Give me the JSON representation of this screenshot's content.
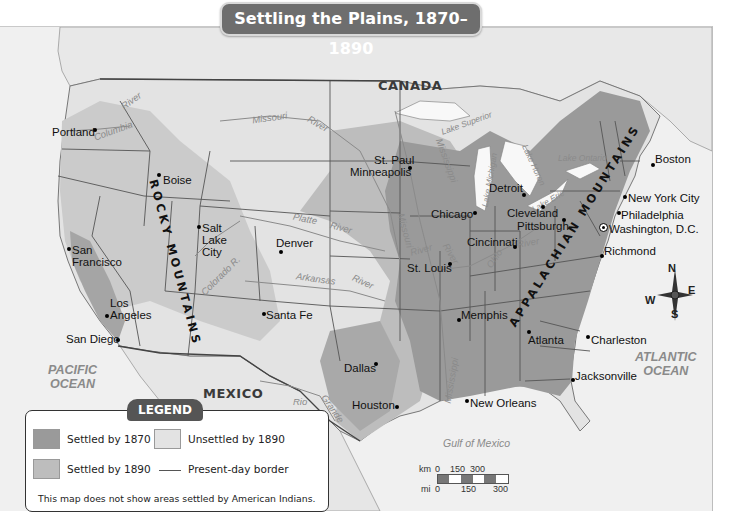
{
  "title": "Settling the Plains, 1870–1890",
  "colors": {
    "settled_1870": "#9a9a9a",
    "settled_1890": "#bdbdbd",
    "unsettled_1890": "#e3e3e3",
    "water": "#f4f4f4",
    "border": "#555555"
  },
  "countries": {
    "canada": "CANADA",
    "mexico": "MEXICO"
  },
  "oceans": {
    "pacific": [
      "PACIFIC",
      "OCEAN"
    ],
    "atlantic": [
      "ATLANTIC",
      "OCEAN"
    ],
    "gulf": "Gulf of Mexico"
  },
  "mountains": {
    "rocky": "ROCKY MOUNTAINS",
    "appalachian": "APPALACHIAN MOUNTAINS"
  },
  "cities": [
    {
      "name": "Portland"
    },
    {
      "name": "Boise"
    },
    {
      "name": "Salt"
    },
    {
      "name": "Lake"
    },
    {
      "name": "City"
    },
    {
      "name": "San"
    },
    {
      "name": "Francisco"
    },
    {
      "name": "Los"
    },
    {
      "name": "Angeles"
    },
    {
      "name": "San Diego"
    },
    {
      "name": "Denver"
    },
    {
      "name": "Santa Fe"
    },
    {
      "name": "Dallas"
    },
    {
      "name": "Houston"
    },
    {
      "name": "St. Paul"
    },
    {
      "name": "Minneapolis"
    },
    {
      "name": "Chicago"
    },
    {
      "name": "St. Louis"
    },
    {
      "name": "Memphis"
    },
    {
      "name": "New Orleans"
    },
    {
      "name": "Detroit"
    },
    {
      "name": "Cleveland"
    },
    {
      "name": "Pittsburgh"
    },
    {
      "name": "Cincinnati"
    },
    {
      "name": "Atlanta"
    },
    {
      "name": "Charleston"
    },
    {
      "name": "Jacksonville"
    },
    {
      "name": "Boston"
    },
    {
      "name": "New York City"
    },
    {
      "name": "Philadelphia"
    },
    {
      "name": "Washington, D.C."
    },
    {
      "name": "Richmond"
    }
  ],
  "rivers": {
    "columbia": "Columbia",
    "river_nw": "River",
    "missouri": "Missouri",
    "missouri_river": "River",
    "platte": "Platte",
    "platte_river": "River",
    "arkansas": "Arkansas",
    "arkansas_river": "River",
    "colorado": "Colorado R.",
    "rio": "Rio",
    "grande": "Grande",
    "mississippi_n": "Mississippi",
    "mississippi_s": "Mississippi",
    "missouri_e": "Missouri",
    "ohio": "Ohio",
    "ohio_river": "River",
    "river_stl": "River",
    "river_mem": "River"
  },
  "lakes": {
    "superior": "Lake Superior",
    "michigan": "Lake Michigan",
    "huron": "Lake Huron",
    "erie": "Lake Erie",
    "ontario": "Lake Ontario"
  },
  "compass": {
    "n": "N",
    "s": "S",
    "e": "E",
    "w": "W"
  },
  "scale": {
    "km_label": "km",
    "km_ticks": [
      "0",
      "150",
      "300"
    ],
    "mi_label": "mi",
    "mi_ticks": [
      "0",
      "150",
      "300"
    ]
  },
  "legend": {
    "title": "LEGEND",
    "items": [
      {
        "label": "Settled by 1870"
      },
      {
        "label": "Unsettled by 1890"
      },
      {
        "label": "Settled by 1890"
      },
      {
        "label": "Present-day border"
      }
    ],
    "note": "This map does not show areas settled by American Indians."
  }
}
